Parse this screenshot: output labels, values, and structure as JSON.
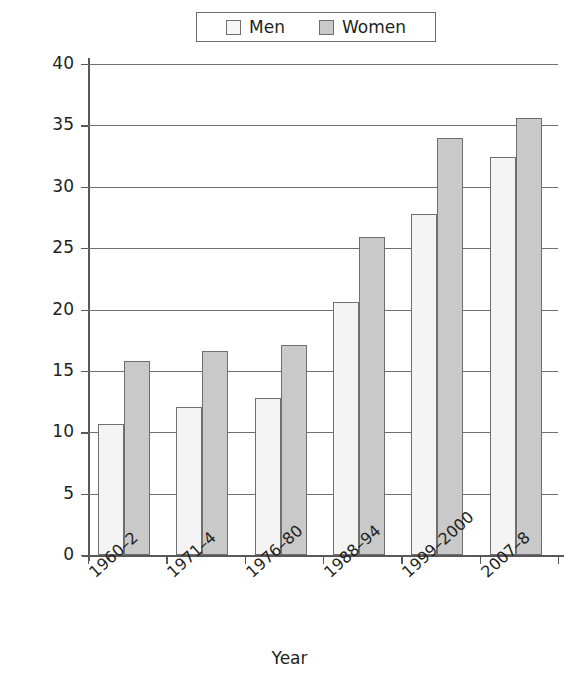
{
  "chart_data": {
    "type": "bar",
    "title": "",
    "xlabel": "Year",
    "ylabel": "% obese",
    "categories": [
      "1960–2",
      "1971–4",
      "1976–80",
      "1988–94",
      "1999–2000",
      "2007–8"
    ],
    "series": [
      {
        "name": "Men",
        "values": [
          10.7,
          12.1,
          12.8,
          20.6,
          27.8,
          32.4
        ],
        "color": "#f4f4f4"
      },
      {
        "name": "Women",
        "values": [
          15.8,
          16.6,
          17.1,
          25.9,
          34.0,
          35.6
        ],
        "color": "#c9c9c9"
      }
    ],
    "ylim": [
      0,
      40
    ],
    "yticks": [
      0,
      5,
      10,
      15,
      20,
      25,
      30,
      35,
      40
    ],
    "ytick_labels": [
      "0",
      "5",
      "10",
      "15",
      "20",
      "25",
      "30",
      "35",
      "40"
    ],
    "grid": true,
    "legend_position": "top-center",
    "legend_entries": [
      "Men",
      "Women"
    ]
  },
  "legend": {
    "men_label": "Men",
    "women_label": "Women"
  },
  "axes": {
    "y_title": "% obese",
    "x_title": "Year"
  }
}
